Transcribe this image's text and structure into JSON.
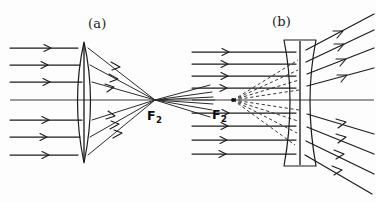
{
  "figure": {
    "background_color": "#fdfdfd",
    "ink_color": "#1c1c1c",
    "width": 376,
    "height": 202,
    "style": "hand-drawn pencil sketch"
  },
  "panels": [
    {
      "id": "panel-a",
      "label": "(a)",
      "label_x": 88,
      "label_y": 28,
      "lens_type": "converging",
      "lens_name": "biconvex lens",
      "focus_label": "F",
      "focus_subscript": "2",
      "focus_label_x": 152,
      "focus_label_y": 118,
      "focal_point_x": 155,
      "focal_point_y": 100,
      "lens_center_x": 84,
      "lens_top_y": 42,
      "lens_bottom_y": 163,
      "lens_half_width": 13,
      "incoming_ray_count": 7,
      "axis_y": 100,
      "ray_start_x": 10,
      "ray_y_positions": [
        48,
        65,
        82,
        100,
        120,
        137,
        155
      ],
      "outgoing_extend_x": 215
    },
    {
      "id": "panel-b",
      "label": "(b)",
      "label_x": 272,
      "label_y": 26,
      "lens_type": "diverging",
      "lens_name": "biconcave lens",
      "focus_label": "F",
      "focus_subscript": "2",
      "focus_label_x": 218,
      "focus_label_y": 117,
      "focal_point_x": 233,
      "focal_point_y": 100,
      "lens_center_x": 300,
      "lens_top_y": 40,
      "lens_bottom_y": 166,
      "lens_edge_half_width": 16,
      "lens_waist_half_width": 7,
      "incoming_ray_count": 9,
      "outgoing_ray_count": 9,
      "virtual_ray_count": 8,
      "axis_y": 100,
      "ray_start_x": 192,
      "ray_y_positions": [
        52,
        64,
        76,
        88,
        100,
        113,
        126,
        140,
        154
      ],
      "outgoing_end_x": 374
    }
  ],
  "legend": {
    "solid_line_meaning": "real ray path",
    "dashed_line_meaning": "virtual ray extension",
    "arrow_meaning": "direction of light propagation"
  }
}
